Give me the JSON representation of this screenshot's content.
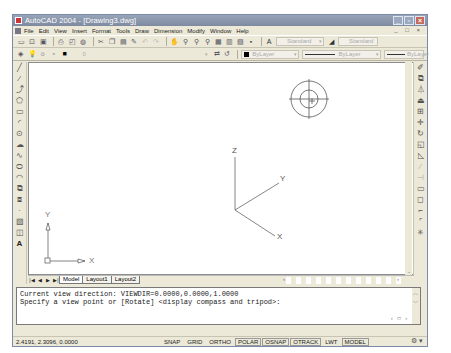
{
  "window": {
    "title": "AutoCAD 2004 - [Drawing3.dwg]",
    "controls": [
      "minimize",
      "maximize",
      "close"
    ]
  },
  "menubar": {
    "items": [
      "File",
      "Edit",
      "View",
      "Insert",
      "Format",
      "Tools",
      "Draw",
      "Dimension",
      "Modify",
      "Window",
      "Help"
    ],
    "mdi_controls": "_ □ ×"
  },
  "toolbar_standard": {
    "icons": [
      "new-icon",
      "open-icon",
      "save-icon",
      "print-icon",
      "print-preview-icon",
      "publish-icon",
      "cut-icon",
      "copy-icon",
      "paste-icon",
      "match-properties-icon",
      "undo-icon",
      "redo-icon",
      "pan-icon",
      "zoom-realtime-icon",
      "zoom-window-icon",
      "zoom-previous-icon",
      "properties-icon",
      "design-center-icon",
      "tool-palettes-icon",
      "help-icon"
    ],
    "text_style": "Standard",
    "dim_style": "Standard"
  },
  "toolbar_layers": {
    "layer_name": "0",
    "color": "ByLayer",
    "linetype": "ByLayer",
    "lineweight": "ByLayer"
  },
  "draw_toolbar": {
    "tools": [
      "line",
      "construction-line",
      "polyline",
      "polygon",
      "rectangle",
      "arc",
      "circle",
      "revision-cloud",
      "spline",
      "ellipse",
      "ellipse-arc",
      "insert-block",
      "make-block",
      "point",
      "hatch",
      "region",
      "multiline-text"
    ]
  },
  "modify_toolbar": {
    "tools": [
      "erase",
      "copy",
      "mirror",
      "offset",
      "array",
      "move",
      "rotate",
      "scale",
      "stretch",
      "trim",
      "extend",
      "break",
      "chamfer",
      "fillet",
      "explode"
    ]
  },
  "canvas": {
    "tripod_labels": {
      "x": "X",
      "y": "Y",
      "z": "Z"
    },
    "ucs_labels": {
      "x": "X",
      "y": "Y"
    }
  },
  "tabs": {
    "items": [
      "Model",
      "Layout1",
      "Layout2"
    ],
    "active": "Model"
  },
  "command_line": {
    "line1": "Current view direction:  VIEWDIR=0.0000,0.0000,1.0000",
    "line2": "Specify a view point or [Rotate] <display compass and tripod>:"
  },
  "statusbar": {
    "coordinates": "2.4191,  2.3096, 0.0000",
    "toggles": [
      {
        "label": "SNAP",
        "on": false
      },
      {
        "label": "GRID",
        "on": false
      },
      {
        "label": "ORTHO",
        "on": false
      },
      {
        "label": "POLAR",
        "on": true
      },
      {
        "label": "OSNAP",
        "on": true
      },
      {
        "label": "OTRACK",
        "on": true
      },
      {
        "label": "LWT",
        "on": false
      },
      {
        "label": "MODEL",
        "on": true
      }
    ]
  },
  "colors": {
    "titlebar": "#8894aa",
    "chrome": "#ece9d8",
    "canvas": "#ffffff"
  }
}
